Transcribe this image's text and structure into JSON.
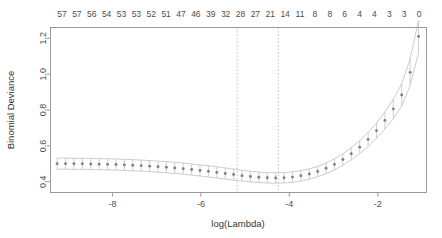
{
  "chart_data": {
    "type": "scatter",
    "title": "",
    "xlabel": "log(Lambda)",
    "ylabel": "Binomial Deviance",
    "xlim": [
      -9.4,
      -0.9
    ],
    "ylim": [
      0.34,
      1.26
    ],
    "xticks": [
      -8,
      -6,
      -4,
      -2
    ],
    "xticklabels": [
      "-8",
      "-6",
      "-4",
      "-2"
    ],
    "yticks": [
      0.4,
      0.6,
      0.8,
      1.0,
      1.2
    ],
    "yticklabels": [
      "0.4",
      "0.6",
      "0.8",
      "1.0",
      "1.2"
    ],
    "grid": false,
    "legend": null,
    "point_color": "#808080",
    "errorbar_color": "#c8c8c8",
    "band_color": "#bfbfbf",
    "vline_color": "#c0c0c0",
    "top_axis_label": "",
    "top_axis_ticklabels": [
      "57",
      "57",
      "56",
      "54",
      "53",
      "53",
      "52",
      "51",
      "47",
      "46",
      "39",
      "32",
      "28",
      "27",
      "21",
      "14",
      "11",
      "8",
      "8",
      "6",
      "4",
      "4",
      "3",
      "3",
      "0"
    ],
    "vlines": [
      -5.18,
      -4.25
    ],
    "series": [
      {
        "name": "Binomial Deviance (mean CV)",
        "x": [
          -9.25,
          -9.06,
          -8.87,
          -8.68,
          -8.49,
          -8.3,
          -8.11,
          -7.92,
          -7.73,
          -7.54,
          -7.35,
          -7.16,
          -6.97,
          -6.78,
          -6.59,
          -6.4,
          -6.21,
          -6.02,
          -5.83,
          -5.64,
          -5.45,
          -5.26,
          -5.07,
          -4.88,
          -4.69,
          -4.5,
          -4.31,
          -4.12,
          -3.93,
          -3.74,
          -3.55,
          -3.36,
          -3.17,
          -2.98,
          -2.79,
          -2.6,
          -2.41,
          -2.22,
          -2.03,
          -1.84,
          -1.65,
          -1.46,
          -1.27,
          -1.08
        ],
        "values": [
          0.501,
          0.501,
          0.5,
          0.5,
          0.499,
          0.498,
          0.497,
          0.496,
          0.494,
          0.492,
          0.49,
          0.487,
          0.484,
          0.481,
          0.477,
          0.473,
          0.468,
          0.463,
          0.458,
          0.452,
          0.446,
          0.44,
          0.434,
          0.429,
          0.425,
          0.422,
          0.421,
          0.422,
          0.426,
          0.433,
          0.443,
          0.457,
          0.475,
          0.497,
          0.524,
          0.556,
          0.593,
          0.636,
          0.685,
          0.742,
          0.806,
          0.884,
          1.01,
          1.21
        ],
        "err_lower": [
          0.47,
          0.47,
          0.469,
          0.469,
          0.468,
          0.467,
          0.466,
          0.465,
          0.463,
          0.461,
          0.459,
          0.456,
          0.453,
          0.45,
          0.446,
          0.442,
          0.437,
          0.432,
          0.427,
          0.421,
          0.415,
          0.409,
          0.404,
          0.399,
          0.396,
          0.393,
          0.392,
          0.393,
          0.397,
          0.404,
          0.414,
          0.428,
          0.445,
          0.466,
          0.492,
          0.522,
          0.557,
          0.597,
          0.642,
          0.694,
          0.752,
          0.822,
          0.936,
          1.12
        ],
        "err_upper": [
          0.532,
          0.532,
          0.531,
          0.531,
          0.53,
          0.529,
          0.528,
          0.527,
          0.525,
          0.523,
          0.521,
          0.518,
          0.515,
          0.512,
          0.508,
          0.504,
          0.499,
          0.494,
          0.489,
          0.483,
          0.477,
          0.471,
          0.464,
          0.459,
          0.454,
          0.451,
          0.45,
          0.451,
          0.455,
          0.462,
          0.472,
          0.486,
          0.505,
          0.528,
          0.556,
          0.59,
          0.629,
          0.675,
          0.728,
          0.79,
          0.86,
          0.946,
          1.084,
          1.3
        ]
      }
    ]
  }
}
